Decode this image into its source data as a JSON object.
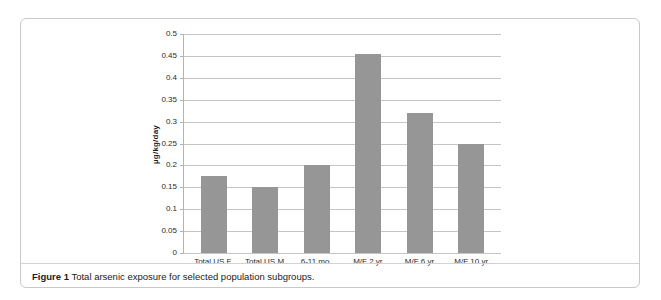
{
  "figure": {
    "caption_label": "Figure 1",
    "caption_text": "Total arsenic exposure for selected population subgroups."
  },
  "chart_data": {
    "type": "bar",
    "title": "",
    "xlabel": "",
    "ylabel": "µg/kg/day",
    "ylim": [
      0,
      0.5
    ],
    "ytick_step": 0.05,
    "yticks": [
      "0.5",
      "0.45",
      "0.4",
      "0.35",
      "0.3",
      "0.25",
      "0.2",
      "0.15",
      "0.1",
      "0.05",
      "0"
    ],
    "ytick_values": [
      0.5,
      0.45,
      0.4,
      0.35,
      0.3,
      0.25,
      0.2,
      0.15,
      0.1,
      0.05,
      0
    ],
    "grid": true,
    "grid_axis": "y",
    "legend": false,
    "bar_color": "#969696",
    "categories": [
      "Total US F",
      "Total US M",
      "6-11 mo.",
      "M/F 2 yr",
      "M/F 6 yr",
      "M/F 10 yr"
    ],
    "values": [
      0.175,
      0.15,
      0.2,
      0.455,
      0.32,
      0.25
    ]
  }
}
